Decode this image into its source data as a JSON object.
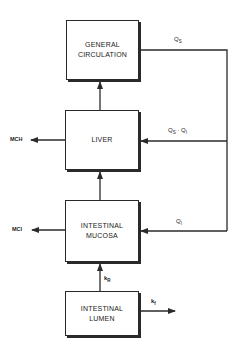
{
  "diagram": {
    "boxes": [
      {
        "id": "general-circulation",
        "line1": "GENERAL",
        "line2": "CIRCULATION"
      },
      {
        "id": "liver",
        "line1": "LIVER",
        "line2": ""
      },
      {
        "id": "intestinal-mucosa",
        "line1": "INTESTINAL",
        "line2": "MUCOSA"
      },
      {
        "id": "intestinal-lumen",
        "line1": "INTESTINAL",
        "line2": "LUMEN"
      }
    ],
    "labels": {
      "qs": {
        "main": "Q",
        "sub": "S"
      },
      "qs_qi": {
        "main1": "Q",
        "sub1": "S",
        "sep": " · ",
        "main2": "Q",
        "sub2": "I"
      },
      "qi": {
        "main": "Q",
        "sub": "I"
      },
      "mch": "MCH",
      "mci": "MCI",
      "kr": {
        "main": "k",
        "sub": "R"
      },
      "kf": {
        "main": "k",
        "sub": "f"
      }
    },
    "line_color": "#2a2a2a"
  }
}
